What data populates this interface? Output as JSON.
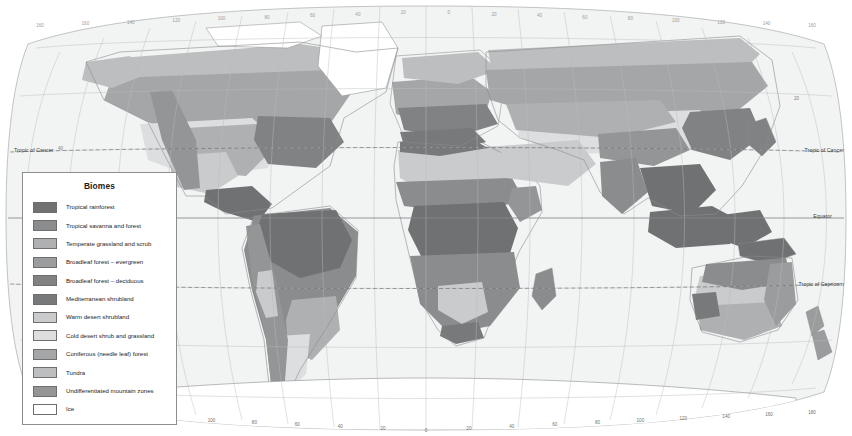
{
  "map": {
    "title": "World Biomes",
    "projection": "robinson",
    "ocean_color": "#f2f3f3",
    "graticule_color": "#b9bcbe",
    "coastline_color": "#8a8d8f",
    "frame_color": "#a9acae",
    "longitude_labels_bottom": [
      "180",
      "160",
      "140",
      "120",
      "100",
      "80",
      "60",
      "40",
      "20",
      "0",
      "20",
      "40",
      "60",
      "80",
      "100",
      "120",
      "140",
      "160",
      "180"
    ],
    "longitude_labels_top": [
      "160",
      "160",
      "140",
      "120",
      "100",
      "80",
      "60",
      "40",
      "20",
      "0",
      "20",
      "40",
      "60",
      "80",
      "100",
      "120",
      "140",
      "160"
    ],
    "latitude_labels": [
      "60",
      "40",
      "20",
      "0",
      "20",
      "40",
      "60"
    ],
    "annotations": {
      "tropic_of_cancer": "Tropic of Cancer",
      "equator": "Equator",
      "tropic_of_capricorn": "Tropic of Capricorn"
    },
    "latitude_label_left": "40",
    "latitude_label_right": "20"
  },
  "legend": {
    "title": "Biomes",
    "items": [
      {
        "label": "Tropical rainforest",
        "color": "#6f7173"
      },
      {
        "label": "Tropical savanna and forest",
        "color": "#8a8c8e"
      },
      {
        "label": "Temperate grassland and scrub",
        "color": "#aeb0b1"
      },
      {
        "label": "Broadleaf forest – evergreen",
        "color": "#9a9c9e"
      },
      {
        "label": "Broadleaf forest – deciduous",
        "color": "#808284"
      },
      {
        "label": "Mediterranean shrubland",
        "color": "#77797b"
      },
      {
        "label": "Warm desert shrubland",
        "color": "#c9cbcc"
      },
      {
        "label": "Cold desert shrub and grassland",
        "color": "#dcdedf"
      },
      {
        "label": "Coniferous (needle leaf) forest",
        "color": "#a4a6a8"
      },
      {
        "label": "Tundra",
        "color": "#bcbebf"
      },
      {
        "label": "Undifferentiated mountain zones",
        "color": "#939597"
      },
      {
        "label": "Ice",
        "color": "#ffffff"
      }
    ]
  }
}
